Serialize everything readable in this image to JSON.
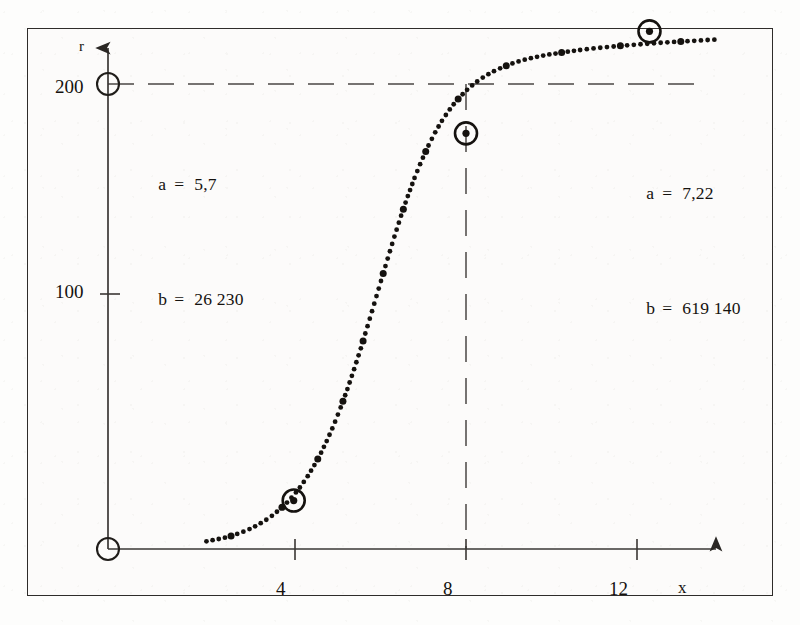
{
  "figure": {
    "axes": {
      "y_label": "r",
      "x_label": "x",
      "y_ticks": [
        "200",
        "100"
      ],
      "x_ticks": [
        "4",
        "8",
        "12"
      ]
    },
    "annotation_left": {
      "line1_symbol": "a",
      "line1_equals": "=",
      "line1_value": "5,7",
      "line2_symbol": "b",
      "line2_equals": "=",
      "line2_value": "26 230"
    },
    "annotation_right": {
      "line1_symbol": "a",
      "line1_equals": "=",
      "line1_value": "7,22",
      "line2_symbol": "b",
      "line2_equals": "=",
      "line2_value": "619 140"
    },
    "colors": {
      "ink": "#15120f",
      "frame": "#2e2c2a",
      "axis": "#3a3734",
      "dashed": "#4a4744",
      "paper": "#fcfbfa"
    }
  },
  "chart_data": {
    "type": "scatter",
    "title": "",
    "xlabel": "x",
    "ylabel": "r",
    "xlim": [
      0,
      14.5
    ],
    "ylim": [
      0,
      215
    ],
    "grid": false,
    "legend": "none",
    "curve_form": "logistic (sigmoid) growth",
    "asymptote": 205,
    "inflection_x": 6.05,
    "xtick_values": [
      4,
      8,
      12
    ],
    "ytick_values": [
      100,
      200
    ],
    "annotations": [
      {
        "position": "upper-left",
        "text": "a = 5,7 ; b = 26 230"
      },
      {
        "position": "upper-right",
        "text": "a = 7,22 ; b = 619 140"
      }
    ],
    "dashed_guides": [
      {
        "orientation": "horizontal",
        "value": 205,
        "from_x": 0,
        "to_x": 13.8
      },
      {
        "orientation": "vertical",
        "value": 8,
        "from_y": 0,
        "to_y": 205
      }
    ],
    "highlighted_points": [
      {
        "x": 4.15,
        "y": 19,
        "marker": "circled-dot"
      },
      {
        "x": 8.0,
        "y": 163,
        "marker": "circled-dot"
      },
      {
        "x": 12.1,
        "y": 203,
        "marker": "circled-dot"
      }
    ],
    "origin_markers": [
      {
        "x": 0,
        "y": 205,
        "marker": "open-circle"
      },
      {
        "x": 0,
        "y": 0,
        "marker": "open-circle"
      }
    ],
    "x": [
      2.2,
      2.35,
      2.5,
      2.65,
      2.8,
      2.95,
      3.1,
      3.25,
      3.4,
      3.55,
      3.7,
      3.85,
      4.0,
      4.15,
      4.3,
      4.45,
      4.6,
      4.75,
      4.9,
      5.05,
      5.2,
      5.35,
      5.5,
      5.65,
      5.8,
      5.95,
      6.1,
      6.25,
      6.4,
      6.55,
      6.7,
      6.85,
      7.0,
      7.15,
      7.3,
      7.45,
      7.6,
      7.75,
      7.9,
      8.05,
      8.2,
      8.35,
      8.5,
      8.65,
      8.8,
      8.95,
      9.1,
      9.25,
      9.4,
      9.55,
      9.7,
      9.85,
      10.0,
      10.3,
      10.6,
      10.9,
      11.2,
      11.5,
      11.8,
      12.1,
      12.4,
      12.7,
      13.0,
      13.3,
      13.6
    ],
    "y": [
      3,
      3.5,
      4,
      4.6,
      5.4,
      6.3,
      7.3,
      8.5,
      10,
      11.6,
      13.5,
      15.7,
      18.2,
      21.1,
      24.4,
      28.2,
      32.5,
      37.3,
      42.8,
      48.8,
      55.5,
      62.7,
      70.5,
      78.7,
      87.4,
      96.2,
      105.1,
      113.9,
      122.5,
      130.7,
      138.4,
      145.5,
      152.0,
      157.8,
      163.0,
      167.6,
      171.5,
      175.0,
      177.9,
      180.5,
      182.7,
      184.6,
      186.2,
      187.6,
      188.8,
      189.9,
      190.8,
      191.6,
      192.3,
      192.9,
      193.4,
      193.9,
      194.3,
      195.1,
      195.8,
      196.4,
      196.9,
      197.4,
      197.8,
      198.2,
      198.6,
      198.9,
      199.2,
      199.5,
      199.8
    ]
  }
}
